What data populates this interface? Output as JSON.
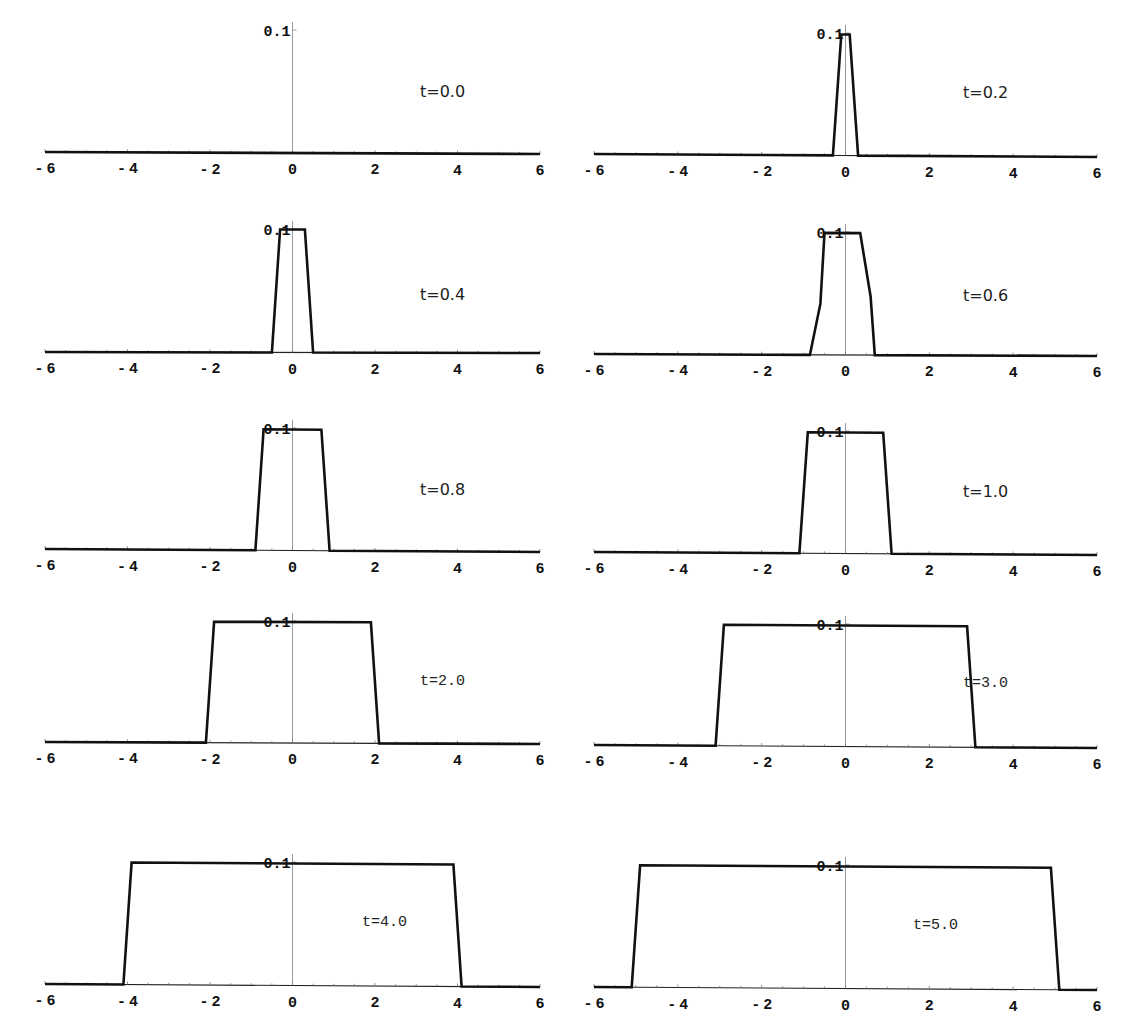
{
  "chart_data": [
    {
      "type": "line",
      "title": "",
      "annotation": "t=0.0",
      "xlabel": "",
      "ylabel": "",
      "xlim": [
        -6,
        6
      ],
      "ylim": [
        0,
        0.1
      ],
      "xticks": [
        "-6",
        "-4",
        "-2",
        "0",
        "2",
        "4",
        "6"
      ],
      "yticks": [
        "0.1"
      ],
      "grid": false,
      "x": [
        -6,
        6
      ],
      "y": [
        0,
        0
      ]
    },
    {
      "type": "line",
      "title": "",
      "annotation": "t=0.2",
      "xlabel": "",
      "ylabel": "",
      "xlim": [
        -6,
        6
      ],
      "ylim": [
        0,
        0.1
      ],
      "xticks": [
        "-6",
        "-4",
        "-2",
        "0",
        "2",
        "4",
        "6"
      ],
      "yticks": [
        "0.1"
      ],
      "grid": false,
      "x": [
        -6,
        -0.3,
        -0.1,
        0.1,
        0.3,
        6
      ],
      "y": [
        0,
        0,
        0.1,
        0.1,
        0,
        0
      ]
    },
    {
      "type": "line",
      "title": "",
      "annotation": "t=0.4",
      "xlabel": "",
      "ylabel": "",
      "xlim": [
        -6,
        6
      ],
      "ylim": [
        0,
        0.1
      ],
      "xticks": [
        "-6",
        "-4",
        "-2",
        "0",
        "2",
        "4",
        "6"
      ],
      "yticks": [
        "0.1"
      ],
      "grid": false,
      "x": [
        -6,
        -0.5,
        -0.3,
        0.3,
        0.5,
        6
      ],
      "y": [
        0,
        0,
        0.1,
        0.1,
        0,
        0
      ]
    },
    {
      "type": "line",
      "title": "",
      "annotation": "t=0.6",
      "xlabel": "",
      "ylabel": "",
      "xlim": [
        -6,
        6
      ],
      "ylim": [
        0,
        0.1
      ],
      "xticks": [
        "-6",
        "-4",
        "-2",
        "0",
        "2",
        "4",
        "6"
      ],
      "yticks": [
        "0.1"
      ],
      "grid": false,
      "x": [
        -6,
        -0.85,
        -0.6,
        -0.5,
        0.35,
        0.6,
        0.7,
        6
      ],
      "y": [
        0,
        0,
        0.042,
        0.1,
        0.1,
        0.048,
        0,
        0
      ]
    },
    {
      "type": "line",
      "title": "",
      "annotation": "t=0.8",
      "xlabel": "",
      "ylabel": "",
      "xlim": [
        -6,
        6
      ],
      "ylim": [
        0,
        0.1
      ],
      "xticks": [
        "-6",
        "-4",
        "-2",
        "0",
        "2",
        "4",
        "6"
      ],
      "yticks": [
        "0.1"
      ],
      "grid": false,
      "x": [
        -6,
        -0.9,
        -0.7,
        0.7,
        0.9,
        6
      ],
      "y": [
        0,
        0,
        0.1,
        0.1,
        0,
        0
      ]
    },
    {
      "type": "line",
      "title": "",
      "annotation": "t=1.0",
      "xlabel": "",
      "ylabel": "",
      "xlim": [
        -6,
        6
      ],
      "ylim": [
        0,
        0.1
      ],
      "xticks": [
        "-6",
        "-4",
        "-2",
        "0",
        "2",
        "4",
        "6"
      ],
      "yticks": [
        "0.1"
      ],
      "grid": false,
      "x": [
        -6,
        -1.1,
        -0.9,
        0.9,
        1.1,
        6
      ],
      "y": [
        0,
        0,
        0.1,
        0.1,
        0,
        0
      ]
    },
    {
      "type": "line",
      "title": "",
      "annotation": "t=2.0",
      "xlabel": "",
      "ylabel": "",
      "xlim": [
        -6,
        6
      ],
      "ylim": [
        0,
        0.1
      ],
      "xticks": [
        "-6",
        "-4",
        "-2",
        "0",
        "2",
        "4",
        "6"
      ],
      "yticks": [
        "0.1"
      ],
      "grid": false,
      "x": [
        -6,
        -2.1,
        -1.9,
        1.9,
        2.1,
        6
      ],
      "y": [
        0,
        0,
        0.1,
        0.1,
        0,
        0
      ]
    },
    {
      "type": "line",
      "title": "",
      "annotation": "t=3.0",
      "xlabel": "",
      "ylabel": "",
      "xlim": [
        -6,
        6
      ],
      "ylim": [
        0,
        0.1
      ],
      "xticks": [
        "-6",
        "-4",
        "-2",
        "0",
        "2",
        "4",
        "6"
      ],
      "yticks": [
        "0.1"
      ],
      "grid": false,
      "x": [
        -6,
        -3.1,
        -2.9,
        2.9,
        3.1,
        6
      ],
      "y": [
        0,
        0,
        0.1,
        0.1,
        0,
        0
      ]
    },
    {
      "type": "line",
      "title": "",
      "annotation": "t=4.0",
      "xlabel": "",
      "ylabel": "",
      "xlim": [
        -6,
        6
      ],
      "ylim": [
        0,
        0.1
      ],
      "xticks": [
        "-6",
        "-4",
        "-2",
        "0",
        "2",
        "4",
        "6"
      ],
      "yticks": [
        "0.1"
      ],
      "grid": false,
      "x": [
        -6,
        -4.1,
        -3.9,
        3.9,
        4.1,
        6
      ],
      "y": [
        0,
        0,
        0.1,
        0.1,
        0,
        0
      ]
    },
    {
      "type": "line",
      "title": "",
      "annotation": "t=5.0",
      "xlabel": "",
      "ylabel": "",
      "xlim": [
        -6,
        6
      ],
      "ylim": [
        0,
        0.1
      ],
      "xticks": [
        "-6",
        "-4",
        "-2",
        "0",
        "2",
        "4",
        "6"
      ],
      "yticks": [
        "0.1"
      ],
      "grid": false,
      "x": [
        -6,
        -5.1,
        -4.9,
        4.9,
        5.1,
        6
      ],
      "y": [
        0,
        0,
        0.1,
        0.1,
        0,
        0
      ]
    }
  ],
  "panels": [
    {
      "annotation": "t=0.0",
      "ylabel": "0.1"
    },
    {
      "annotation": "t=0.2",
      "ylabel": "0.1"
    },
    {
      "annotation": "t=0.4",
      "ylabel": "0.1"
    },
    {
      "annotation": "t=0.6",
      "ylabel": "0.1"
    },
    {
      "annotation": "t=0.8",
      "ylabel": "0.1"
    },
    {
      "annotation": "t=1.0",
      "ylabel": "0.1"
    },
    {
      "annotation": "t=2.0",
      "ylabel": "0.1"
    },
    {
      "annotation": "t=3.0",
      "ylabel": "0.1"
    },
    {
      "annotation": "t=4.0",
      "ylabel": "0.1"
    },
    {
      "annotation": "t=5.0",
      "ylabel": "0.1"
    }
  ],
  "colors": {
    "curve": "#111111",
    "axis": "#222222",
    "yaxis": "#999999",
    "background": "#ffffff"
  }
}
